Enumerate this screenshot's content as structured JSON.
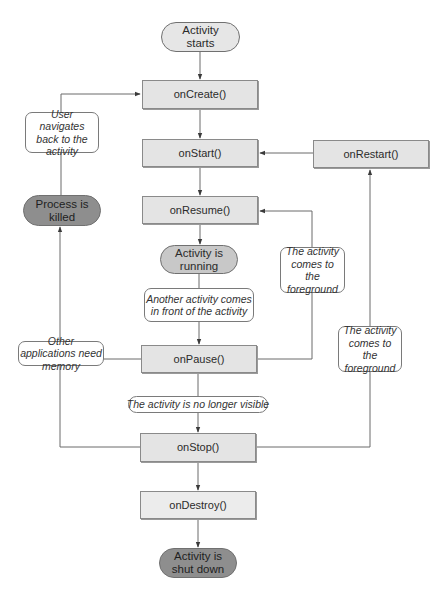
{
  "diagram": {
    "colors": {
      "method_fill": "#e4e4e4",
      "terminal_dark": "#8e8e8e",
      "running_fill": "#c8c8c8",
      "line": "#6a6a6a"
    },
    "nodes": {
      "activity_starts": "Activity starts",
      "on_create": "onCreate()",
      "on_start": "onStart()",
      "on_restart": "onRestart()",
      "on_resume": "onResume()",
      "activity_running": "Activity is running",
      "on_pause": "onPause()",
      "on_stop": "onStop()",
      "on_destroy": "onDestroy()",
      "activity_shut_down": "Activity is shut down",
      "process_killed": "Process is killed"
    },
    "notes": {
      "user_navigates_back": "User navigates back to the activity",
      "another_activity_front": "Another activity comes in front of the activity",
      "foreground_to_resume": "The activity comes to the foreground",
      "foreground_to_restart": "The activity comes to the foreground",
      "other_apps_need_memory": "Other applications need memory",
      "no_longer_visible": "The activity is no longer visible"
    },
    "edges": [
      {
        "from": "activity_starts",
        "to": "on_create"
      },
      {
        "from": "on_create",
        "to": "on_start"
      },
      {
        "from": "on_start",
        "to": "on_resume"
      },
      {
        "from": "on_resume",
        "to": "activity_running"
      },
      {
        "from": "activity_running",
        "to": "on_pause",
        "label": "another_activity_front"
      },
      {
        "from": "on_pause",
        "to": "on_stop",
        "label": "no_longer_visible"
      },
      {
        "from": "on_stop",
        "to": "on_destroy"
      },
      {
        "from": "on_destroy",
        "to": "activity_shut_down"
      },
      {
        "from": "on_pause",
        "to": "on_resume",
        "label": "foreground_to_resume"
      },
      {
        "from": "on_stop",
        "to": "on_restart",
        "label": "foreground_to_restart"
      },
      {
        "from": "on_restart",
        "to": "on_start"
      },
      {
        "from": "on_pause",
        "to": "process_killed",
        "label": "other_apps_need_memory"
      },
      {
        "from": "on_stop",
        "to": "process_killed",
        "label": "other_apps_need_memory"
      },
      {
        "from": "process_killed",
        "to": "on_create",
        "label": "user_navigates_back"
      }
    ]
  }
}
